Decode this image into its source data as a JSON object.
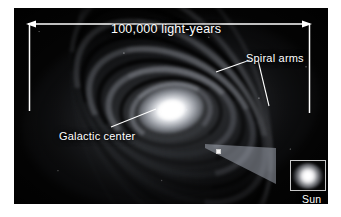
{
  "figure": {
    "plate_background": "#050505",
    "annotation_color": "#ffffff",
    "border_color": "#ffffff"
  },
  "annotations": {
    "scale_bar": {
      "label": "100,000 light-years",
      "arrow_style": "double-headed",
      "left_tick": true,
      "right_tick": true
    },
    "spiral_arms": {
      "label": "Spiral arms",
      "leader_lines": 2
    },
    "galactic_center": {
      "label": "Galactic center",
      "leader_lines": 1
    },
    "sun": {
      "label": "Sun",
      "marker": "small-square",
      "inset": "magnified-view"
    }
  }
}
